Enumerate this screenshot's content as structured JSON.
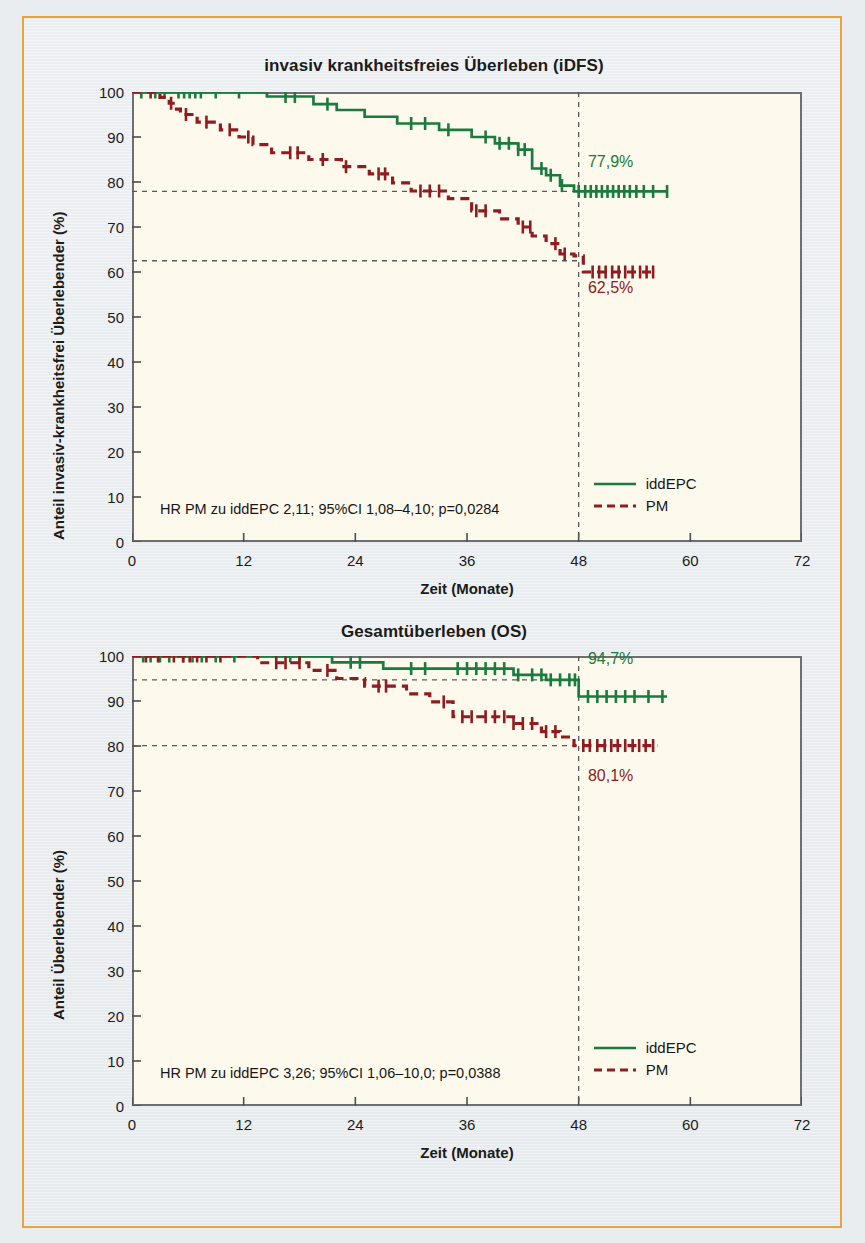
{
  "figure": {
    "frame_color": "#e8a33d",
    "background": "#e9edf0",
    "plot_background": "#fdf9ec",
    "axis_color": "#6d6f70"
  },
  "series_colors": {
    "iddEPC": "#1b7a3d",
    "PM": "#8e1c20"
  },
  "panels": [
    {
      "id": "idfs",
      "title": "invasiv krankheitsfreies Überleben (iDFS)",
      "y_title": "Anteil invasiv-krankheitsfrei Überlebender (%)",
      "x_title": "Zeit (Monate)",
      "y_ticks": [
        "100",
        "90",
        "80",
        "70",
        "60",
        "50",
        "40",
        "30",
        "20",
        "10",
        "0"
      ],
      "x_ticks": [
        "0",
        "12",
        "24",
        "36",
        "48",
        "60",
        "72"
      ],
      "stat_note": "HR PM zu iddEPC 2,11; 95%CI 1,08–4,10; p=0,0284",
      "legend": [
        {
          "label": "iddEPC",
          "style": "solid",
          "color": "#1b7a3d"
        },
        {
          "label": "PM",
          "style": "dashed",
          "color": "#8e1c20"
        }
      ],
      "curve_labels": [
        {
          "text": "77,9%",
          "color": "#1b7a3d"
        },
        {
          "text": "62,5%",
          "color": "#8e1c20"
        }
      ]
    },
    {
      "id": "os",
      "title": "Gesamtüberleben (OS)",
      "y_title": "Anteil Überlebender (%)",
      "x_title": "Zeit (Monate)",
      "y_ticks": [
        "100",
        "90",
        "80",
        "70",
        "60",
        "50",
        "40",
        "30",
        "20",
        "10",
        "0"
      ],
      "x_ticks": [
        "0",
        "12",
        "24",
        "36",
        "48",
        "60",
        "72"
      ],
      "stat_note": "HR PM zu iddEPC 3,26; 95%CI 1,06–10,0; p=0,0388",
      "legend": [
        {
          "label": "iddEPC",
          "style": "solid",
          "color": "#1b7a3d"
        },
        {
          "label": "PM",
          "style": "dashed",
          "color": "#8e1c20"
        }
      ],
      "curve_labels": [
        {
          "text": "94,7%",
          "color": "#1b7a3d"
        },
        {
          "text": "80,1%",
          "color": "#8e1c20"
        }
      ]
    }
  ],
  "chart_data": [
    {
      "type": "line",
      "chart_id": "idfs",
      "title": "invasiv krankheitsfreies Überleben (iDFS)",
      "xlabel": "Zeit (Monate)",
      "ylabel": "Anteil invasiv-krankheitsfrei Überlebender (%)",
      "xlim": [
        0,
        72
      ],
      "ylim": [
        0,
        100
      ],
      "xticks": [
        0,
        12,
        24,
        36,
        48,
        60,
        72
      ],
      "yticks": [
        0,
        10,
        20,
        30,
        40,
        50,
        60,
        70,
        80,
        90,
        100
      ],
      "grid": false,
      "legend_position": "bottom-right",
      "annotations": [
        {
          "text": "HR PM zu iddEPC 2,11; 95%CI 1,08–4,10; p=0,0284",
          "x": 3,
          "y": 7
        },
        {
          "text": "77,9%",
          "x": 49,
          "y": 84,
          "color": "#1b7a3d"
        },
        {
          "text": "62,5%",
          "x": 49,
          "y": 56,
          "color": "#8e1c20"
        }
      ],
      "reference_lines": [
        {
          "orientation": "vertical",
          "x": 48,
          "style": "dashed"
        },
        {
          "orientation": "horizontal",
          "y": 77.9,
          "style": "dashed",
          "x_to": 48
        },
        {
          "orientation": "horizontal",
          "y": 62.5,
          "style": "dashed",
          "x_to": 48
        }
      ],
      "landmark": {
        "month": 48,
        "iddEPC_percent": 77.9,
        "PM_percent": 62.5
      },
      "series": [
        {
          "name": "iddEPC",
          "style": "solid",
          "color": "#1b7a3d",
          "steps": [
            [
              0,
              100
            ],
            [
              14.5,
              100
            ],
            [
              14.5,
              99.0
            ],
            [
              19.5,
              99.0
            ],
            [
              19.5,
              97.3
            ],
            [
              22.0,
              97.3
            ],
            [
              22.0,
              96.0
            ],
            [
              25.0,
              96.0
            ],
            [
              25.0,
              94.5
            ],
            [
              28.5,
              94.5
            ],
            [
              28.5,
              93.0
            ],
            [
              33.0,
              93.0
            ],
            [
              33.0,
              91.6
            ],
            [
              36.5,
              91.6
            ],
            [
              36.5,
              90.0
            ],
            [
              39.0,
              90.0
            ],
            [
              39.0,
              88.6
            ],
            [
              41.5,
              88.6
            ],
            [
              41.5,
              87.2
            ],
            [
              43.0,
              87.2
            ],
            [
              43.0,
              83.0
            ],
            [
              44.5,
              83.0
            ],
            [
              44.5,
              81.5
            ],
            [
              46.0,
              81.5
            ],
            [
              46.0,
              79.2
            ],
            [
              47.5,
              79.2
            ],
            [
              47.5,
              77.9
            ],
            [
              57.5,
              77.9
            ]
          ],
          "censor_months": [
            1.0,
            2.5,
            3.5,
            5.0,
            5.6,
            6.2,
            6.8,
            7.4,
            9.0,
            11.5,
            16.5,
            17.5,
            21.0,
            30.0,
            31.5,
            34.0,
            38.0,
            39.5,
            40.5,
            41.5,
            42.2,
            44.0,
            45.0,
            46.2,
            48.0,
            48.7,
            49.3,
            49.9,
            50.5,
            51.1,
            51.7,
            52.3,
            52.9,
            53.5,
            54.2,
            55.0,
            56.0,
            57.5
          ]
        },
        {
          "name": "PM",
          "style": "dashed",
          "color": "#8e1c20",
          "steps": [
            [
              0,
              100
            ],
            [
              3.0,
              100
            ],
            [
              3.0,
              98.8
            ],
            [
              4.0,
              98.8
            ],
            [
              4.0,
              97.5
            ],
            [
              4.6,
              97.5
            ],
            [
              4.6,
              96.2
            ],
            [
              5.2,
              96.2
            ],
            [
              5.2,
              95.0
            ],
            [
              7.0,
              95.0
            ],
            [
              7.0,
              93.3
            ],
            [
              9.5,
              93.3
            ],
            [
              9.5,
              91.6
            ],
            [
              11.5,
              91.6
            ],
            [
              11.5,
              90.0
            ],
            [
              13.0,
              90.0
            ],
            [
              13.0,
              88.3
            ],
            [
              15.0,
              88.3
            ],
            [
              15.0,
              86.5
            ],
            [
              19.0,
              86.5
            ],
            [
              19.0,
              85.0
            ],
            [
              22.5,
              85.0
            ],
            [
              22.5,
              83.4
            ],
            [
              25.5,
              83.4
            ],
            [
              25.5,
              81.8
            ],
            [
              28.0,
              81.8
            ],
            [
              28.0,
              79.8
            ],
            [
              30.0,
              79.8
            ],
            [
              30.0,
              78.0
            ],
            [
              34.0,
              78.0
            ],
            [
              34.0,
              76.3
            ],
            [
              36.5,
              76.3
            ],
            [
              36.5,
              73.6
            ],
            [
              39.5,
              73.6
            ],
            [
              39.5,
              71.8
            ],
            [
              41.5,
              71.8
            ],
            [
              41.5,
              70.0
            ],
            [
              43.0,
              70.0
            ],
            [
              43.0,
              68.0
            ],
            [
              44.5,
              68.0
            ],
            [
              44.5,
              66.3
            ],
            [
              46.0,
              66.3
            ],
            [
              46.0,
              64.0
            ],
            [
              47.5,
              64.0
            ],
            [
              47.5,
              63.6
            ],
            [
              48.5,
              63.6
            ],
            [
              48.5,
              60.0
            ],
            [
              56.0,
              60.0
            ]
          ],
          "censor_months": [
            2.0,
            4.2,
            5.8,
            8.0,
            10.5,
            12.5,
            17.0,
            17.8,
            20.5,
            23.0,
            26.5,
            27.2,
            31.0,
            32.0,
            33.0,
            37.0,
            38.0,
            42.0,
            42.8,
            45.5,
            46.5,
            49.5,
            50.2,
            50.9,
            51.6,
            52.3,
            53.0,
            53.8,
            54.6,
            55.3,
            56.0
          ]
        }
      ]
    },
    {
      "type": "line",
      "chart_id": "os",
      "title": "Gesamtüberleben (OS)",
      "xlabel": "Zeit (Monate)",
      "ylabel": "Anteil Überlebender (%)",
      "xlim": [
        0,
        72
      ],
      "ylim": [
        0,
        100
      ],
      "xticks": [
        0,
        12,
        24,
        36,
        48,
        60,
        72
      ],
      "yticks": [
        0,
        10,
        20,
        30,
        40,
        50,
        60,
        70,
        80,
        90,
        100
      ],
      "grid": false,
      "legend_position": "bottom-right",
      "annotations": [
        {
          "text": "HR PM zu iddEPC 3,26; 95%CI 1,06–10,0; p=0,0388",
          "x": 3,
          "y": 7
        },
        {
          "text": "94,7%",
          "x": 49,
          "y": 99,
          "color": "#1b7a3d"
        },
        {
          "text": "80,1%",
          "x": 49,
          "y": 73,
          "color": "#8e1c20"
        }
      ],
      "reference_lines": [
        {
          "orientation": "vertical",
          "x": 48,
          "style": "dashed"
        },
        {
          "orientation": "horizontal",
          "y": 94.7,
          "style": "dashed",
          "x_to": 48
        },
        {
          "orientation": "horizontal",
          "y": 80.1,
          "style": "dashed",
          "x_to": 48
        }
      ],
      "landmark": {
        "month": 48,
        "iddEPC_percent": 94.7,
        "PM_percent": 80.1
      },
      "series": [
        {
          "name": "iddEPC",
          "style": "solid",
          "color": "#1b7a3d",
          "steps": [
            [
              0,
              100
            ],
            [
              21.5,
              100
            ],
            [
              21.5,
              98.6
            ],
            [
              27.0,
              98.6
            ],
            [
              27.0,
              97.2
            ],
            [
              41.0,
              97.2
            ],
            [
              41.0,
              95.8
            ],
            [
              44.5,
              95.8
            ],
            [
              44.5,
              94.7
            ],
            [
              48.0,
              94.7
            ],
            [
              48.0,
              91.0
            ],
            [
              57.5,
              91.0
            ]
          ],
          "censor_months": [
            1.2,
            2.0,
            3.0,
            4.0,
            5.5,
            6.5,
            7.5,
            9.0,
            11.0,
            17.0,
            18.0,
            23.5,
            24.5,
            30.0,
            31.5,
            35.0,
            36.0,
            37.0,
            38.0,
            39.0,
            40.0,
            41.5,
            43.0,
            44.0,
            45.0,
            46.0,
            47.0,
            47.6,
            49.0,
            50.0,
            51.0,
            52.0,
            53.0,
            54.0,
            55.5,
            57.0
          ]
        },
        {
          "name": "PM",
          "style": "dashed",
          "color": "#8e1c20",
          "steps": [
            [
              0,
              100
            ],
            [
              13.5,
              100
            ],
            [
              13.5,
              98.5
            ],
            [
              19.0,
              98.5
            ],
            [
              19.0,
              96.8
            ],
            [
              22.0,
              96.8
            ],
            [
              22.0,
              95.0
            ],
            [
              25.0,
              95.0
            ],
            [
              25.0,
              93.3
            ],
            [
              29.5,
              93.3
            ],
            [
              29.5,
              91.6
            ],
            [
              32.0,
              91.6
            ],
            [
              32.0,
              89.8
            ],
            [
              34.5,
              89.8
            ],
            [
              34.5,
              86.5
            ],
            [
              41.0,
              86.5
            ],
            [
              41.0,
              85.0
            ],
            [
              44.0,
              85.0
            ],
            [
              44.0,
              83.2
            ],
            [
              46.0,
              83.2
            ],
            [
              46.0,
              82.0
            ],
            [
              47.5,
              82.0
            ],
            [
              47.5,
              80.1
            ],
            [
              56.5,
              80.1
            ]
          ],
          "censor_months": [
            1.5,
            2.8,
            4.5,
            5.5,
            6.2,
            7.0,
            8.0,
            9.5,
            15.5,
            16.5,
            18.0,
            21.0,
            26.5,
            27.3,
            33.5,
            35.5,
            36.5,
            38.0,
            39.0,
            40.0,
            41.0,
            42.0,
            43.0,
            44.5,
            45.5,
            48.5,
            49.2,
            50.0,
            50.8,
            51.5,
            52.2,
            53.0,
            53.8,
            54.5,
            55.2,
            56.0
          ]
        }
      ]
    }
  ]
}
